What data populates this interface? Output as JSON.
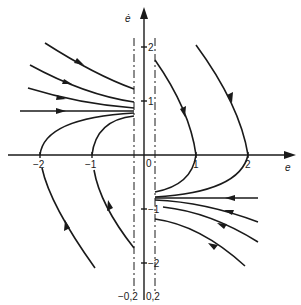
{
  "figure": {
    "type": "phase-plane",
    "axes": {
      "x_label": "e",
      "y_label": "ė",
      "x_ticks": [
        "−2",
        "−1",
        "0",
        "1",
        "2"
      ],
      "y_ticks": [
        "2",
        "1",
        "−1",
        "−2"
      ]
    },
    "dead_zone_lines": {
      "left_label": "−0,2",
      "right_label": "0,2"
    },
    "colors": {
      "ink": "#1a1a1a",
      "background": "#ffffff"
    }
  }
}
